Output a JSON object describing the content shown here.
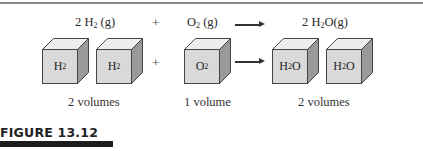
{
  "figure": {
    "label": "FIGURE 13.12"
  },
  "equation": {
    "reactant1": {
      "coef": "2",
      "formula": "H",
      "sub": "2",
      "state": " (g)"
    },
    "plus": "+",
    "reactant2": {
      "formula": "O",
      "sub": "2",
      "state": " (g)"
    },
    "arrow": "→",
    "product": {
      "coef": "2",
      "formula": "H",
      "sub": "2",
      "rest": "O(g)"
    }
  },
  "cubes": [
    {
      "label_main": "H",
      "label_sub": "2",
      "label_rest": ""
    },
    {
      "label_main": "H",
      "label_sub": "2",
      "label_rest": ""
    },
    {
      "label_main": "O",
      "label_sub": "2",
      "label_rest": ""
    },
    {
      "label_main": "H",
      "label_sub": "2",
      "label_rest": "O"
    },
    {
      "label_main": "H",
      "label_sub": "2",
      "label_rest": "O"
    }
  ],
  "volumes": {
    "reactant1": "2 volumes",
    "reactant2": "1 volume",
    "product": "2 volumes"
  },
  "colors": {
    "cube_front": "#d9d9d9",
    "cube_top": "#eeeeee",
    "cube_side": "#9a9a9a",
    "cube_edge": "#444444"
  }
}
